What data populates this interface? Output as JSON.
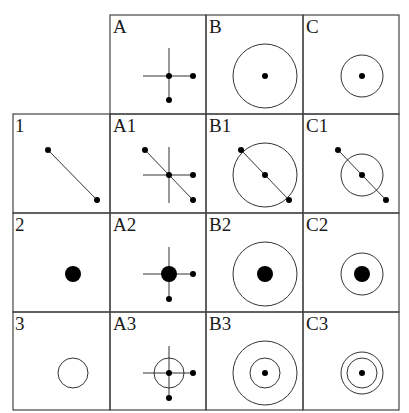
{
  "diagram": {
    "type": "composition-matrix",
    "columns": [
      {
        "id": "A",
        "label": "A",
        "primitive": "cross-with-dots"
      },
      {
        "id": "B",
        "label": "B",
        "primitive": "large-circle-with-center-dot"
      },
      {
        "id": "C",
        "label": "C",
        "primitive": "small-circle-with-center-dot"
      }
    ],
    "rows": [
      {
        "id": "1",
        "label": "1",
        "primitive": "diagonal-line-with-end-dots"
      },
      {
        "id": "2",
        "label": "2",
        "primitive": "large-filled-dot"
      },
      {
        "id": "3",
        "label": "3",
        "primitive": "small-empty-circle"
      }
    ],
    "cells": {
      "A": "A",
      "B": "B",
      "C": "C",
      "r1": "1",
      "A1": "A1",
      "B1": "B1",
      "C1": "C1",
      "r2": "2",
      "A2": "A2",
      "B2": "B2",
      "C2": "C2",
      "r3": "3",
      "A3": "A3",
      "B3": "B3",
      "C3": "C3"
    },
    "colors": {
      "stroke": "#333333",
      "fill": "#000000",
      "border": "#444444",
      "background": "#ffffff"
    }
  }
}
